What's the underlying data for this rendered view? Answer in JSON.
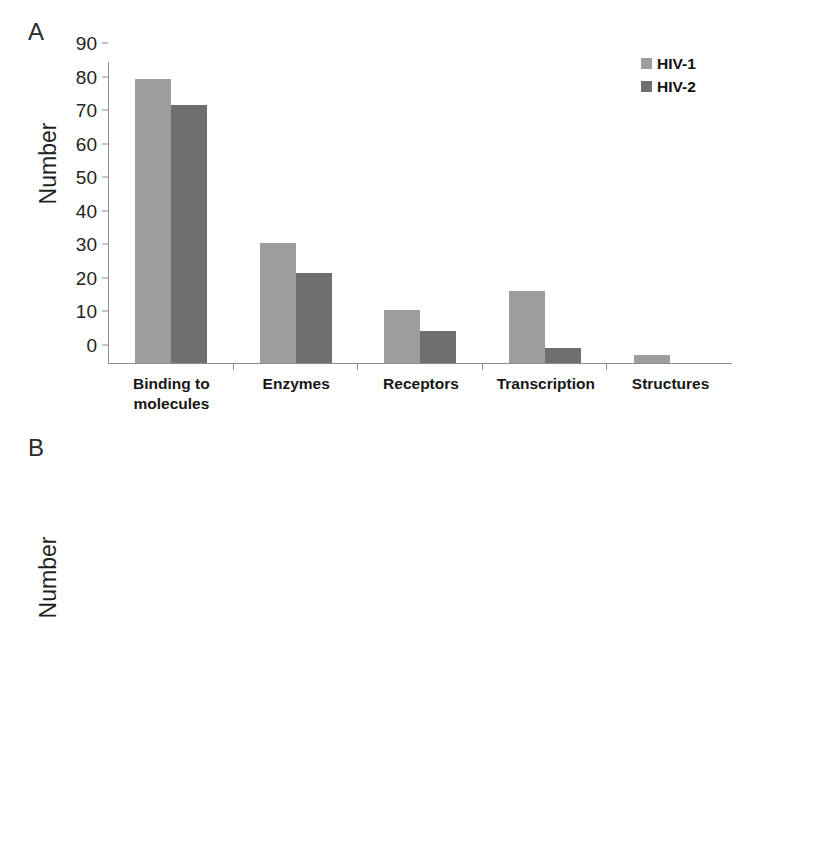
{
  "figure": {
    "panels": [
      {
        "letter": "A",
        "legend_position": "top-right",
        "chart_data": {
          "type": "bar",
          "title": "",
          "xlabel": "",
          "ylabel": "Number",
          "ylim": [
            0,
            90
          ],
          "yticks": [
            0,
            10,
            20,
            30,
            40,
            50,
            60,
            70,
            80,
            90
          ],
          "grid": false,
          "categories": [
            "Binding to molecules",
            "Enzymes",
            "Receptors",
            "Transcription",
            "Structures"
          ],
          "series": [
            {
              "name": "HIV-1",
              "color": "#9d9d9d",
              "values": [
                85,
                36,
                16,
                21.5,
                2.5
              ]
            },
            {
              "name": "HIV-2",
              "color": "#6f6f6f",
              "values": [
                77,
                27,
                9.5,
                4.5,
                0
              ]
            }
          ]
        }
      },
      {
        "letter": "B",
        "legend_position": "top-right",
        "chart_data": {
          "type": "bar",
          "title": "",
          "xlabel": "",
          "ylabel": "Number",
          "ylim": [
            0,
            35
          ],
          "yticks": [
            0,
            5,
            10,
            15,
            20,
            25,
            30,
            35
          ],
          "grid": false,
          "categories": [
            "Signal transduction",
            "Metabolism",
            "Gene expression",
            "Cell differentiation",
            "Cell cycle"
          ],
          "series": [
            {
              "name": "HIV-1",
              "color": "#9d9d9d",
              "values": [
                33,
                30,
                27,
                20,
                15
              ]
            },
            {
              "name": "HIV-2",
              "color": "#6f6f6f",
              "values": [
                20,
                24,
                30,
                9.7,
                11.8
              ]
            }
          ]
        }
      }
    ]
  }
}
